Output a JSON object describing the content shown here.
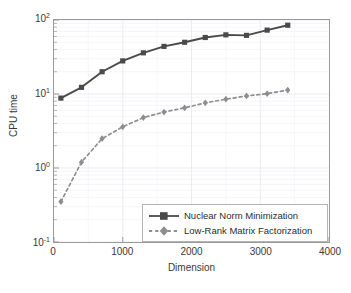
{
  "chart_data": {
    "type": "line",
    "title": "",
    "xlabel": "Dimension",
    "ylabel": "CPU time",
    "xlim": [
      0,
      4000
    ],
    "ylim": [
      0.1,
      100
    ],
    "yscale": "log",
    "xscale": "linear",
    "grid": true,
    "minor_grid": true,
    "legend_position": "lower right",
    "xticks": [
      "0",
      "1000",
      "2000",
      "3000",
      "4000"
    ],
    "xtick_values": [
      0,
      1000,
      2000,
      3000,
      4000
    ],
    "yticks": [
      "10^-1",
      "10^0",
      "10^1",
      "10^2"
    ],
    "ytick_values": [
      0.1,
      1,
      10,
      100
    ],
    "x": [
      100,
      400,
      700,
      1000,
      1300,
      1600,
      1900,
      2200,
      2500,
      2800,
      3100,
      3400
    ],
    "series": [
      {
        "name": "Nuclear Norm Minimization",
        "values": [
          8.8,
          12.3,
          20.0,
          28.0,
          36.0,
          44.0,
          50.0,
          58.0,
          63.0,
          62.0,
          73.0,
          85.0
        ],
        "color": "#4a4a4a",
        "linestyle": "solid",
        "marker": "square"
      },
      {
        "name": "Low-Rank Matrix Factorization",
        "values": [
          0.35,
          1.2,
          2.5,
          3.6,
          4.8,
          5.7,
          6.5,
          7.6,
          8.5,
          9.4,
          10.1,
          11.3
        ],
        "color": "#8e8e8e",
        "linestyle": "dashed",
        "marker": "diamond"
      }
    ]
  },
  "axes": {
    "ytick_labels": [
      {
        "mantissa": "10",
        "exponent": "2",
        "value": 100
      },
      {
        "mantissa": "10",
        "exponent": "1",
        "value": 10
      },
      {
        "mantissa": "10",
        "exponent": "0",
        "value": 1
      },
      {
        "mantissa": "10",
        "exponent": "-1",
        "value": 0.1
      }
    ]
  },
  "legend": {
    "entries": [
      {
        "label": "Nuclear Norm Minimization"
      },
      {
        "label": "Low-Rank Matrix Factorization"
      }
    ]
  },
  "colors": {
    "series_1": "#4a4a4a",
    "series_2": "#8e8e8e",
    "grid": "#e8e8f2",
    "minor_grid": "#f2f2f8",
    "axis": "#9a9a9a",
    "text": "#3a3a3a",
    "background": "#ffffff"
  }
}
